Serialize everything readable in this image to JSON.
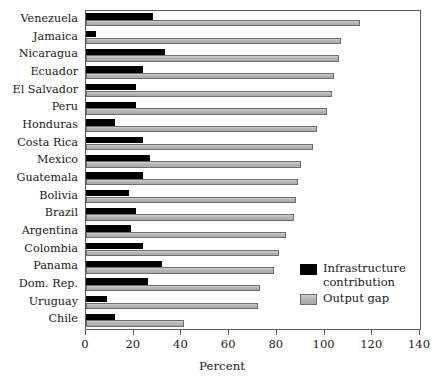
{
  "chart_data": {
    "type": "bar",
    "orientation": "horizontal",
    "title": "",
    "xlabel": "Percent",
    "ylabel": "",
    "xlim": [
      0,
      140
    ],
    "xticks": [
      0,
      20,
      40,
      60,
      80,
      100,
      120,
      140
    ],
    "grid": false,
    "legend_position": "inside-right-lower",
    "categories": [
      "Venezuela",
      "Jamaica",
      "Nicaragua",
      "Ecuador",
      "El Salvador",
      "Peru",
      "Honduras",
      "Costa Rica",
      "Mexico",
      "Guatemala",
      "Bolivia",
      "Brazil",
      "Argentina",
      "Colombia",
      "Panama",
      "Dom. Rep.",
      "Uruguay",
      "Chile"
    ],
    "series": [
      {
        "name": "Infrastructure contribution",
        "color": "#000000",
        "values": [
          28,
          4,
          33,
          24,
          21,
          21,
          12,
          24,
          27,
          24,
          18,
          21,
          19,
          24,
          32,
          26,
          9,
          12
        ]
      },
      {
        "name": "Output gap",
        "color": "#b5b5b5",
        "values": [
          115,
          107,
          106,
          104,
          103,
          101,
          97,
          95,
          90,
          89,
          88,
          87,
          84,
          81,
          79,
          73,
          72,
          41
        ]
      }
    ]
  },
  "legend": {
    "items": [
      {
        "label_line1": "Infrastructure",
        "label_line2": "contribution",
        "swatch": "black"
      },
      {
        "label_line1": "Output gap",
        "label_line2": "",
        "swatch": "gray"
      }
    ]
  },
  "axis": {
    "x_title": "Percent"
  },
  "colors": {
    "bar_black": "#000000",
    "bar_gray": "#b5b5b5",
    "frame": "#5a5a5a",
    "text": "#1a1a1a",
    "background": "#ffffff"
  }
}
